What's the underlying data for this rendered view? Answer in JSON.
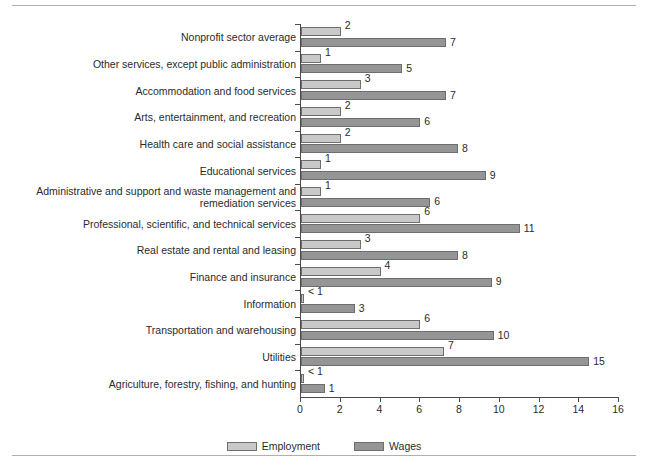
{
  "chart_data": {
    "type": "bar",
    "orientation": "horizontal",
    "title": "",
    "xlabel": "",
    "ylabel": "",
    "xlim": [
      0,
      16
    ],
    "xticks": [
      0,
      2,
      4,
      6,
      8,
      10,
      12,
      14,
      16
    ],
    "grid": false,
    "legend_position": "bottom-center",
    "categories": [
      "Nonprofit sector average",
      "Other services, except public administration",
      "Accommodation and food services",
      "Arts, entertainment, and recreation",
      "Health care and social assistance",
      "Educational services",
      "Administrative and support and waste management and\nremediation services",
      "Professional, scientific, and technical services",
      "Real estate and rental and leasing",
      "Finance and insurance",
      "Information",
      "Transportation and warehousing",
      "Utilities",
      "Agriculture, forestry, fishing, and hunting"
    ],
    "series": [
      {
        "name": "Employment",
        "color": "#c9c9c9",
        "values": [
          2,
          1,
          3,
          2,
          2,
          1,
          1,
          6,
          3,
          4,
          0.15,
          6,
          7.2,
          0.15
        ],
        "labels": [
          "2",
          "1",
          "3",
          "2",
          "2",
          "1",
          "1",
          "6",
          "3",
          "4",
          "< 1",
          "6",
          "7",
          "< 1"
        ]
      },
      {
        "name": "Wages",
        "color": "#959595",
        "values": [
          7.3,
          5.1,
          7.3,
          6,
          7.9,
          9.3,
          6.5,
          11,
          7.9,
          9.6,
          2.7,
          9.7,
          14.5,
          1.2
        ],
        "labels": [
          "7",
          "5",
          "7",
          "6",
          "8",
          "9",
          "6",
          "11",
          "8",
          "9",
          "3",
          "10",
          "15",
          "1"
        ]
      }
    ]
  },
  "legend": {
    "items": [
      {
        "label": "Employment",
        "swatch": "employment"
      },
      {
        "label": "Wages",
        "swatch": "wages"
      }
    ]
  }
}
